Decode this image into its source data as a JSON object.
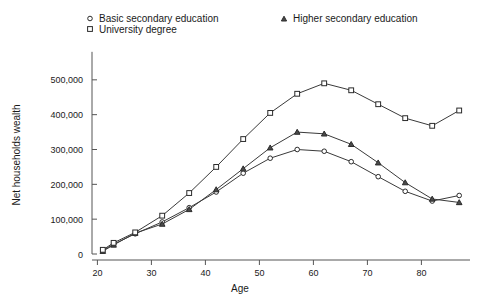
{
  "chart_data": {
    "type": "line",
    "title": "",
    "subtitle": "",
    "xlabel": "Age",
    "ylabel": "Net households wealth",
    "xlim": [
      19,
      89
    ],
    "ylim": [
      0,
      600000
    ],
    "xticks": [
      20,
      30,
      40,
      50,
      60,
      70,
      80
    ],
    "xtick_labels": [
      "20",
      "30",
      "40",
      "50",
      "60",
      "70",
      "80"
    ],
    "yticks": [
      0,
      100000,
      200000,
      300000,
      400000,
      500000
    ],
    "ytick_labels": [
      "0",
      "100,000",
      "200,000",
      "300,000",
      "400,000",
      "500,000"
    ],
    "grid": false,
    "legend_position": "top",
    "x": [
      21,
      23,
      27,
      32,
      37,
      42,
      47,
      52,
      57,
      62,
      67,
      72,
      77,
      82,
      87
    ],
    "series": [
      {
        "name": "Basic secondary education",
        "marker": "circle",
        "values": [
          10000,
          28000,
          58000,
          92000,
          133000,
          178000,
          232000,
          275000,
          300000,
          295000,
          265000,
          222000,
          180000,
          152000,
          168000
        ]
      },
      {
        "name": "Higher secondary education",
        "marker": "triangle",
        "values": [
          8000,
          26000,
          60000,
          86000,
          128000,
          185000,
          245000,
          305000,
          350000,
          345000,
          315000,
          262000,
          205000,
          158000,
          148000
        ]
      },
      {
        "name": "University degree",
        "marker": "square",
        "values": [
          12000,
          32000,
          62000,
          110000,
          175000,
          250000,
          330000,
          405000,
          460000,
          490000,
          470000,
          430000,
          390000,
          368000,
          412000
        ]
      }
    ],
    "colors": {
      "line": "#3a3a3a",
      "axis": "#555555",
      "text": "#1a1a1a",
      "background": "#ffffff"
    }
  },
  "legend": {
    "entries": [
      {
        "label": "Basic secondary education",
        "marker": "circle-marker-icon"
      },
      {
        "label": "Higher secondary education",
        "marker": "triangle-marker-icon"
      },
      {
        "label": "University degree",
        "marker": "square-marker-icon"
      }
    ]
  }
}
